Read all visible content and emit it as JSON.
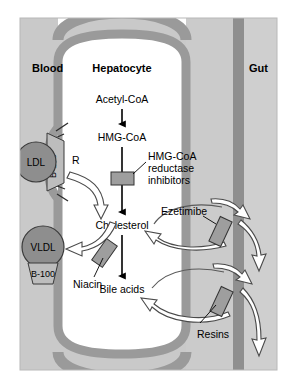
{
  "figure": {
    "compartments": {
      "blood": "Blood",
      "cell": "Hepatocyte",
      "gut": "Gut"
    },
    "pathway": {
      "step1": "Acetyl-CoA",
      "step2": "HMG-CoA",
      "step3": "Cholesterol",
      "step4": "Bile acids"
    },
    "particles": {
      "ldl": "LDL",
      "ldl_apo": "B-100",
      "vldl": "VLDL",
      "vldl_apo": "B-100",
      "receptor": "R"
    },
    "drugs": {
      "statins": "HMG-CoA\nreductase\ninhibitors",
      "statins_line1": "HMG-CoA",
      "statins_line2": "reductase",
      "statins_line3": "inhibitors",
      "niacin": "Niacin",
      "ezetimibe": "Ezetimibe",
      "resins": "Resins"
    },
    "colors": {
      "page_background": "#ffffff",
      "plasma_background": "#c9c9c9",
      "gut_lumen": "#cfcfcf",
      "cell_interior": "#ffffff",
      "membrane": "#9a9a9a",
      "membrane_outline": "#8a8a8a",
      "gut_wall": "#8f8f8f",
      "particle_fill": "#8e8e8e",
      "particle_stroke": "#3a3a3a",
      "apo_fill": "#bdbdbd",
      "transporter_fill": "#9e9e9e",
      "transporter_stroke": "#333333",
      "arrow_solid": "#000000",
      "arrow_hollow_fill": "#ffffff",
      "arrow_hollow_stroke": "#4a4a4a",
      "text": "#000000"
    }
  }
}
